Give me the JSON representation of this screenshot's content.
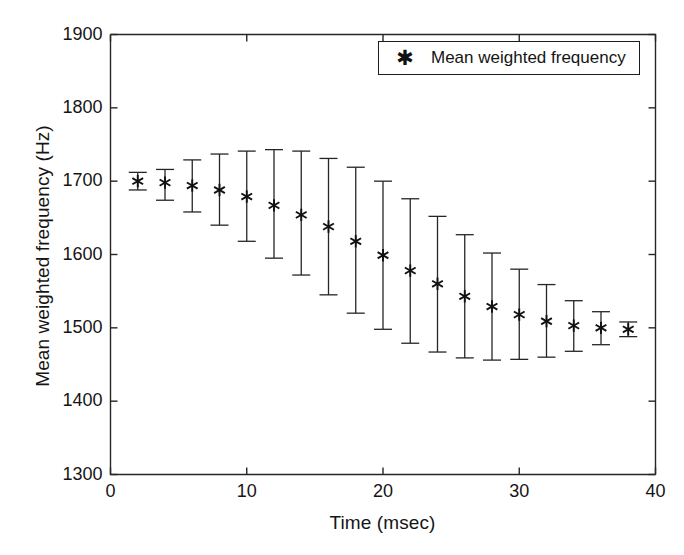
{
  "chart_data": {
    "type": "scatter",
    "title": "",
    "xlabel": "Time (msec)",
    "ylabel": "Mean weighted frequency (Hz)",
    "xlim": [
      0,
      40
    ],
    "ylim": [
      1300,
      1900
    ],
    "xticks": [
      0,
      10,
      20,
      30,
      40
    ],
    "yticks": [
      1300,
      1400,
      1500,
      1600,
      1700,
      1800,
      1900
    ],
    "xtick_labels": [
      "0",
      "10",
      "20",
      "30",
      "40"
    ],
    "ytick_labels": [
      "1300",
      "1400",
      "1500",
      "1600",
      "1700",
      "1800",
      "1900"
    ],
    "grid": false,
    "marker": "asterisk",
    "error_bars": true,
    "legend": {
      "position": "top-right",
      "entries": [
        {
          "label": "Mean weighted frequency",
          "marker": "*"
        }
      ]
    },
    "series": [
      {
        "name": "Mean weighted frequency",
        "x": [
          2,
          4,
          6,
          8,
          10,
          12,
          14,
          16,
          18,
          20,
          22,
          24,
          26,
          28,
          30,
          32,
          34,
          36,
          38
        ],
        "y": [
          1700,
          1698,
          1694,
          1688,
          1679,
          1667,
          1654,
          1638,
          1618,
          1599,
          1578,
          1560,
          1543,
          1529,
          1518,
          1509,
          1503,
          1500,
          1498
        ],
        "y_upper": [
          1712,
          1716,
          1729,
          1737,
          1741,
          1743,
          1741,
          1731,
          1719,
          1700,
          1676,
          1652,
          1627,
          1602,
          1580,
          1559,
          1537,
          1522,
          1508
        ],
        "y_lower": [
          1688,
          1674,
          1658,
          1640,
          1618,
          1595,
          1572,
          1545,
          1520,
          1498,
          1479,
          1467,
          1459,
          1456,
          1457,
          1460,
          1468,
          1477,
          1488
        ]
      }
    ]
  },
  "axes": {
    "x_title": "Time (msec)",
    "y_title": "Mean weighted frequency (Hz)"
  },
  "legend": {
    "marker_glyph": "✱",
    "label": "Mean weighted frequency"
  }
}
